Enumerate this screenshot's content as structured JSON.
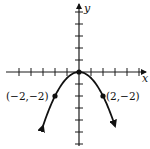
{
  "chart_data": {
    "type": "line",
    "title": "",
    "function": "y = -x^2/2",
    "xlabel": "x",
    "ylabel": "y",
    "xlim": [
      -6,
      5.5
    ],
    "ylim": [
      -6,
      5.5
    ],
    "grid": false,
    "tick_spacing": 1,
    "x_ticks": [
      -5,
      -4,
      -3,
      -2,
      -1,
      1,
      2,
      3,
      4,
      5
    ],
    "y_ticks": [
      5,
      4,
      3,
      2,
      1,
      -1,
      -2,
      -3,
      -4,
      -5,
      -6
    ],
    "series": [
      {
        "name": "parabola",
        "x": [
          -3,
          -2.5,
          -2,
          -1.5,
          -1,
          -0.5,
          0,
          0.5,
          1,
          1.5,
          2,
          2.5,
          3
        ],
        "y": [
          -4.5,
          -3.125,
          -2,
          -1.125,
          -0.5,
          -0.125,
          0,
          -0.125,
          -0.5,
          -1.125,
          -2,
          -3.125,
          -4.5
        ]
      }
    ],
    "points": [
      {
        "x": 0,
        "y": 0,
        "label": ""
      },
      {
        "x": -2,
        "y": -2,
        "label": "(−2,−2)"
      },
      {
        "x": 2,
        "y": -2,
        "label": "(2,−2)"
      }
    ],
    "annotations": [
      "(−2,−2)",
      "(2,−2)"
    ]
  },
  "labels": {
    "x_axis": "x",
    "y_axis": "y",
    "point_left": "(−2,−2)",
    "point_right": "(2,−2)"
  }
}
